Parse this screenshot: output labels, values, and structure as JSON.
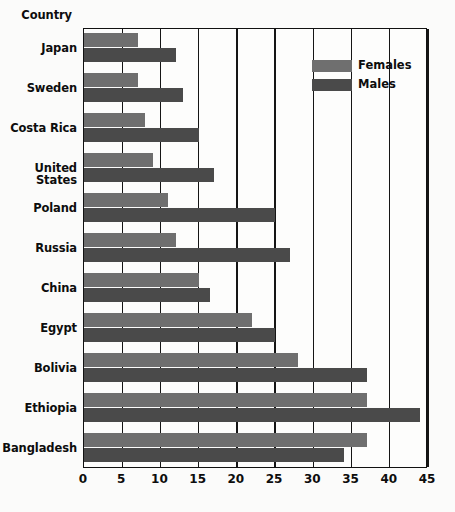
{
  "chart_data": {
    "type": "bar",
    "orientation": "horizontal",
    "title": "",
    "ylabel": "Country",
    "xlabel": "",
    "categories": [
      "Japan",
      "Sweden",
      "Costa Rica",
      "United States",
      "Poland",
      "Russia",
      "China",
      "Egypt",
      "Bolivia",
      "Ethiopia",
      "Bangladesh"
    ],
    "series": [
      {
        "name": "Females",
        "color": "#6f6f6f",
        "values": [
          7,
          7,
          8,
          9,
          11,
          12,
          15,
          22,
          28,
          37,
          37
        ]
      },
      {
        "name": "Males",
        "color": "#4a4a4a",
        "values": [
          12,
          13,
          15,
          17,
          25,
          27,
          16.5,
          25,
          37,
          44,
          34
        ]
      }
    ],
    "xlim": [
      0,
      45
    ],
    "xticks": [
      0,
      5,
      10,
      15,
      20,
      25,
      30,
      35,
      40,
      45
    ],
    "xtick_labels": [
      "0",
      "5",
      "10",
      "15",
      "20",
      "25",
      "30",
      "35",
      "40",
      "45"
    ],
    "grid": true,
    "grid_axis": "x",
    "legend_position": "top-right",
    "legend": [
      "Females",
      "Males"
    ]
  },
  "colors": {
    "female": "#6f6f6f",
    "male": "#4a4a4a",
    "axis": "#111111",
    "text": "#0d0d0d",
    "background": "#fbfbfa"
  }
}
